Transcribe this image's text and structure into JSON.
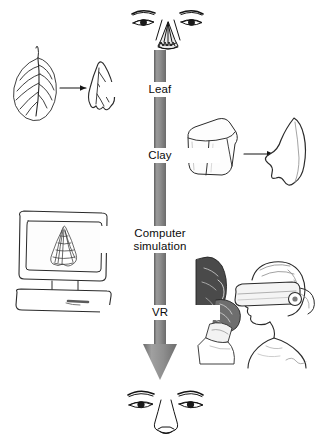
{
  "figure": {
    "background_color": "#ffffff",
    "ink_color": "#141414",
    "arrow_color": "#8a8a8a"
  },
  "process_arrow": {
    "name": "downward-process-arrow",
    "direction": "down",
    "color": "#8a8a8a"
  },
  "stages": [
    {
      "id": "leaf",
      "label": "Leaf"
    },
    {
      "id": "clay",
      "label": "Clay"
    },
    {
      "id": "simulation",
      "label_line1": "Computer",
      "label_line2": "simulation"
    },
    {
      "id": "vr",
      "label": "VR"
    }
  ],
  "illustrations": {
    "face_top": {
      "name": "face-with-damaged-nose",
      "caption": ""
    },
    "face_bottom": {
      "name": "face-with-reconstructed-nose",
      "caption": ""
    },
    "leaf_panel": {
      "name": "leaf-to-nose-template",
      "source": "leaf",
      "result": "nose-shaped-leaf-cutout",
      "connector": "arrow-right"
    },
    "clay_panel": {
      "name": "clay-block-to-nose-model",
      "source": "clay-cube",
      "result": "sculpted-nose-form",
      "connector": "arrow-right"
    },
    "monitor_panel": {
      "name": "computer-monitor-with-wireframe-nose",
      "screen_content": "wireframe-mesh-nose"
    },
    "vr_panel": {
      "name": "vr-user-with-headset-and-glove",
      "elements": [
        "virtual-head-model",
        "data-glove",
        "vr-headset",
        "technician"
      ]
    }
  }
}
